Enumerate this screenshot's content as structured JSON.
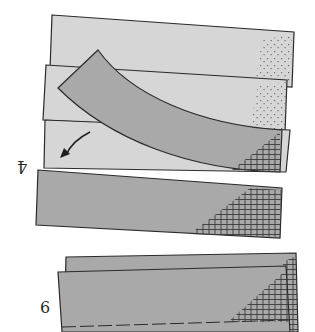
{
  "diagram": {
    "steps": [
      {
        "label": "4"
      },
      {
        "label": "6"
      }
    ],
    "colors": {
      "light_strip": "#d6d6d6",
      "dark_strip": "#a9a9a9",
      "outline": "#2b2b2b",
      "hatch": "#3a3a3a",
      "stipple": "#555555",
      "background": "#ffffff"
    }
  }
}
